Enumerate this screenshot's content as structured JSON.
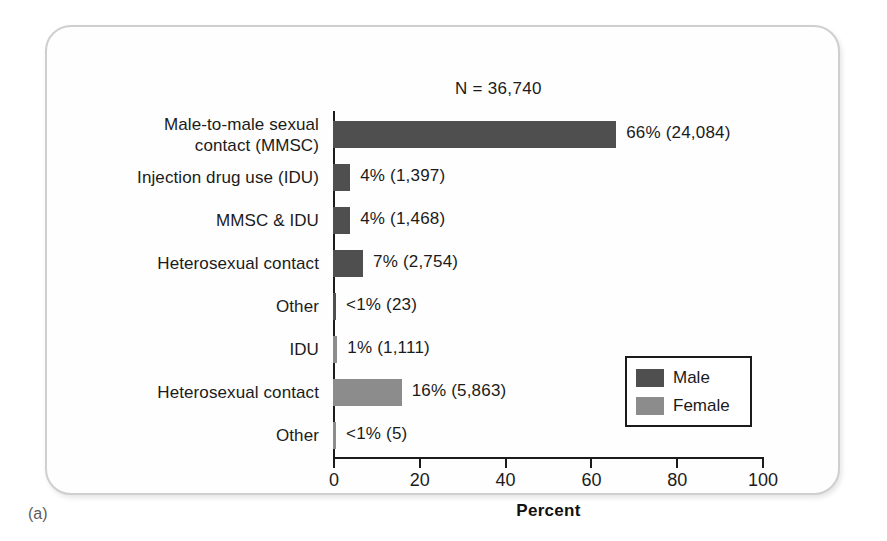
{
  "figure": {
    "panel_caption": "(a)",
    "n_label": "N = 36,740"
  },
  "chart_data": {
    "type": "bar",
    "orientation": "horizontal",
    "title": "N = 36,740",
    "xlabel": "Percent",
    "ylabel": "",
    "xlim": [
      0,
      100
    ],
    "xticks": [
      0,
      20,
      40,
      60,
      80,
      100
    ],
    "xtick_labels": [
      "0",
      "20",
      "40",
      "60",
      "80",
      "100"
    ],
    "grid": false,
    "legend_position": "lower-right",
    "colors": {
      "male": "#4f4f4f",
      "female": "#8c8c8c",
      "axis": "#1b1b1b",
      "card_border": "#cfcfcf",
      "text": "#1b1b1b"
    },
    "legend": [
      {
        "name": "Male",
        "color": "#4f4f4f"
      },
      {
        "name": "Female",
        "color": "#8c8c8c"
      }
    ],
    "categories": [
      "Male-to-male sexual\ncontact (MMSC)",
      "Injection drug use (IDU)",
      "MMSC & IDU",
      "Heterosexual contact",
      "Other",
      "IDU",
      "Heterosexual contact",
      "Other"
    ],
    "values": [
      66,
      4,
      4,
      7,
      0.4,
      1,
      16,
      0.3
    ],
    "counts": [
      24084,
      1397,
      1468,
      2754,
      23,
      1111,
      5863,
      5
    ],
    "data_labels": [
      "66% (24,084)",
      "4% (1,397)",
      "4% (1,468)",
      "7% (2,754)",
      "<1% (23)",
      "1% (1,111)",
      "16% (5,863)",
      "<1% (5)"
    ],
    "series_of_bar": [
      "Male",
      "Male",
      "Male",
      "Male",
      "Male",
      "Female",
      "Female",
      "Female"
    ],
    "bars": [
      {
        "label": "Male-to-male sexual\ncontact (MMSC)",
        "value": 66,
        "count": 24084,
        "data_label": "66% (24,084)",
        "series": "Male",
        "color": "#4f4f4f"
      },
      {
        "label": "Injection drug use (IDU)",
        "value": 4,
        "count": 1397,
        "data_label": "4% (1,397)",
        "series": "Male",
        "color": "#4f4f4f"
      },
      {
        "label": "MMSC & IDU",
        "value": 4,
        "count": 1468,
        "data_label": "4% (1,468)",
        "series": "Male",
        "color": "#4f4f4f"
      },
      {
        "label": "Heterosexual contact",
        "value": 7,
        "count": 2754,
        "data_label": "7% (2,754)",
        "series": "Male",
        "color": "#4f4f4f"
      },
      {
        "label": "Other",
        "value": 0.4,
        "count": 23,
        "data_label": "<1% (23)",
        "series": "Male",
        "color": "#4f4f4f"
      },
      {
        "label": "IDU",
        "value": 1,
        "count": 1111,
        "data_label": "1% (1,111)",
        "series": "Female",
        "color": "#8c8c8c"
      },
      {
        "label": "Heterosexual contact",
        "value": 16,
        "count": 5863,
        "data_label": "16% (5,863)",
        "series": "Female",
        "color": "#8c8c8c"
      },
      {
        "label": "Other",
        "value": 0.3,
        "count": 5,
        "data_label": "<1% (5)",
        "series": "Female",
        "color": "#8c8c8c"
      }
    ]
  }
}
